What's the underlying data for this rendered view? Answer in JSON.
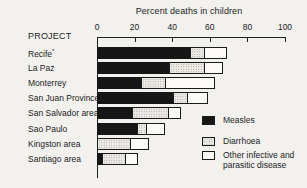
{
  "figure": {
    "title": "Percent deaths in children",
    "row_header": "PROJECT"
  },
  "chart_data": {
    "type": "bar",
    "orientation": "horizontal",
    "stacked": true,
    "title": "Percent deaths in children",
    "row_header": "PROJECT",
    "categories": [
      "Recife*",
      "La Paz",
      "Monterrey",
      "San Juan Province",
      "San Salvador area",
      "Sao Paulo",
      "Kingston area",
      "Santiago area"
    ],
    "series": [
      {
        "name": "Measles",
        "style": "solid-black",
        "values": [
          50,
          39,
          24,
          41,
          19,
          22,
          0,
          3
        ]
      },
      {
        "name": "Diarrhoea",
        "style": "stipple",
        "values": [
          8,
          19,
          13,
          8,
          20,
          5,
          18,
          13
        ]
      },
      {
        "name": "Other infective and parasitic disease",
        "style": "open-white",
        "values": [
          12,
          10,
          27,
          11,
          7,
          10,
          10,
          7
        ]
      }
    ],
    "totals": [
      70,
      68,
      64,
      60,
      46,
      37,
      28,
      23
    ],
    "xlim": [
      0,
      100
    ],
    "xticks": [
      0,
      20,
      40,
      60,
      80,
      100
    ],
    "grid": false,
    "legend_position": "bottom-right"
  },
  "colors": {
    "background": "#f2f1ee",
    "ink": "#1c1c1c",
    "bar_black": "#161616",
    "stipple_base": "#eceae5",
    "stipple_dot": "#97948c",
    "segment_white": "#fbfaf7"
  }
}
